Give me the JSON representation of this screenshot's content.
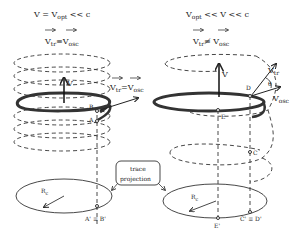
{
  "left_panel": {
    "line1": {
      "main": "V  = V",
      "sub": "opt",
      "tail": " << c"
    },
    "line2": {
      "a": "V",
      "a_sub": "tr",
      "rel": "≡",
      "b": "V",
      "b_sub": "osc"
    },
    "velocity_label": "V",
    "side_label": {
      "a": "V",
      "a_sub": "tr",
      "rel": " =",
      "b": "V",
      "b_sub": "osc"
    },
    "points": [
      "B",
      "A"
    ],
    "projection_label": "A' ≡ B'",
    "radius_label": {
      "main": "R",
      "sub": "c"
    }
  },
  "right_panel": {
    "line1": {
      "a": "V",
      "a_sub": "opt",
      "tail": " << V << c"
    },
    "line2": {
      "a": "V",
      "a_sub": "tr",
      "rel": "≢",
      "b": "V",
      "b_sub": "osc"
    },
    "velocity_label": "V",
    "vtr_label": {
      "main": "V",
      "sub": "tr"
    },
    "vosc_label": {
      "main": "V",
      "sub": "osc"
    },
    "angle_label": "θ",
    "points": [
      "D",
      "E",
      "C"
    ],
    "projection_labels": [
      "E'",
      "C' ≡ D'"
    ],
    "radius_label": {
      "main": "R",
      "sub": "c"
    }
  },
  "callout": {
    "line1": "trace",
    "line2": "projection"
  }
}
